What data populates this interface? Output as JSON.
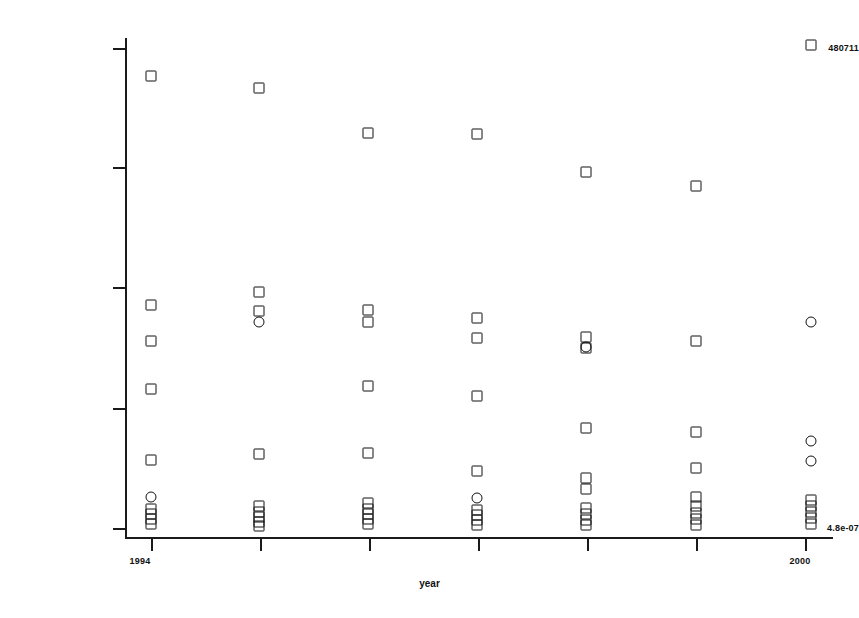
{
  "chart_data": {
    "type": "scatter",
    "title": "",
    "subtitle": "",
    "xlabel": "year",
    "ylabel": "",
    "grid": false,
    "legend": null,
    "yscale": "log",
    "ylim": [
      4.8e-07,
      480711
    ],
    "xlim": [
      1994,
      2000
    ],
    "y_tick_labels": [
      "480711",
      "",
      "",
      "",
      "4.8e-07"
    ],
    "y_tick_label_top": "480711",
    "y_tick_label_bottom": "4.8e-07",
    "x_tick_labels": [
      "1994",
      "",
      "",
      "",
      "",
      "",
      "2000"
    ],
    "x_tick_label_first": "1994",
    "x_tick_label_last": "2000",
    "x_categories": [
      1994,
      1995,
      1996,
      1997,
      1998,
      1999,
      2000
    ],
    "marker_shapes": [
      "square",
      "circle"
    ],
    "marker_color": "#111111",
    "marker_fill": "none",
    "series": [
      {
        "name": "square-markers",
        "shape": "square",
        "points": [
          {
            "x": 1994,
            "px": 151,
            "py": 76
          },
          {
            "x": 1994,
            "px": 151,
            "py": 305
          },
          {
            "x": 1994,
            "px": 151,
            "py": 341
          },
          {
            "x": 1994,
            "px": 151,
            "py": 389
          },
          {
            "x": 1994,
            "px": 151,
            "py": 460
          },
          {
            "x": 1994,
            "px": 151,
            "py": 509
          },
          {
            "x": 1994,
            "px": 151,
            "py": 514
          },
          {
            "x": 1994,
            "px": 151,
            "py": 519
          },
          {
            "x": 1994,
            "px": 151,
            "py": 524
          },
          {
            "x": 1995,
            "px": 259,
            "py": 88
          },
          {
            "x": 1995,
            "px": 259,
            "py": 292
          },
          {
            "x": 1995,
            "px": 259,
            "py": 311
          },
          {
            "x": 1995,
            "px": 259,
            "py": 454
          },
          {
            "x": 1995,
            "px": 259,
            "py": 506
          },
          {
            "x": 1995,
            "px": 259,
            "py": 512
          },
          {
            "x": 1995,
            "px": 259,
            "py": 517
          },
          {
            "x": 1995,
            "px": 259,
            "py": 522
          },
          {
            "x": 1995,
            "px": 259,
            "py": 526
          },
          {
            "x": 1996,
            "px": 368,
            "py": 133
          },
          {
            "x": 1996,
            "px": 368,
            "py": 310
          },
          {
            "x": 1996,
            "px": 368,
            "py": 322
          },
          {
            "x": 1996,
            "px": 368,
            "py": 386
          },
          {
            "x": 1996,
            "px": 368,
            "py": 453
          },
          {
            "x": 1996,
            "px": 368,
            "py": 503
          },
          {
            "x": 1996,
            "px": 368,
            "py": 509
          },
          {
            "x": 1996,
            "px": 368,
            "py": 514
          },
          {
            "x": 1996,
            "px": 368,
            "py": 519
          },
          {
            "x": 1996,
            "px": 368,
            "py": 524
          },
          {
            "x": 1997,
            "px": 477,
            "py": 134
          },
          {
            "x": 1997,
            "px": 477,
            "py": 318
          },
          {
            "x": 1997,
            "px": 477,
            "py": 338
          },
          {
            "x": 1997,
            "px": 477,
            "py": 396
          },
          {
            "x": 1997,
            "px": 477,
            "py": 471
          },
          {
            "x": 1997,
            "px": 477,
            "py": 510
          },
          {
            "x": 1997,
            "px": 477,
            "py": 515
          },
          {
            "x": 1997,
            "px": 477,
            "py": 520
          },
          {
            "x": 1997,
            "px": 477,
            "py": 525
          },
          {
            "x": 1998,
            "px": 586,
            "py": 172
          },
          {
            "x": 1998,
            "px": 586,
            "py": 337
          },
          {
            "x": 1998,
            "px": 586,
            "py": 348
          },
          {
            "x": 1998,
            "px": 586,
            "py": 428
          },
          {
            "x": 1998,
            "px": 586,
            "py": 478
          },
          {
            "x": 1998,
            "px": 586,
            "py": 489
          },
          {
            "x": 1998,
            "px": 586,
            "py": 508
          },
          {
            "x": 1998,
            "px": 586,
            "py": 514
          },
          {
            "x": 1998,
            "px": 586,
            "py": 520
          },
          {
            "x": 1998,
            "px": 586,
            "py": 525
          },
          {
            "x": 1999,
            "px": 696,
            "py": 186
          },
          {
            "x": 1999,
            "px": 696,
            "py": 341
          },
          {
            "x": 1999,
            "px": 696,
            "py": 432
          },
          {
            "x": 1999,
            "px": 696,
            "py": 468
          },
          {
            "x": 1999,
            "px": 696,
            "py": 497
          },
          {
            "x": 1999,
            "px": 696,
            "py": 506
          },
          {
            "x": 1999,
            "px": 696,
            "py": 513
          },
          {
            "x": 1999,
            "px": 696,
            "py": 519
          },
          {
            "x": 1999,
            "px": 696,
            "py": 525
          },
          {
            "x": 2000,
            "px": 811,
            "py": 45
          },
          {
            "x": 2000,
            "px": 811,
            "py": 500
          },
          {
            "x": 2000,
            "px": 811,
            "py": 506
          },
          {
            "x": 2000,
            "px": 811,
            "py": 512
          },
          {
            "x": 2000,
            "px": 811,
            "py": 518
          },
          {
            "x": 2000,
            "px": 811,
            "py": 524
          }
        ]
      },
      {
        "name": "circle-markers",
        "shape": "circle",
        "points": [
          {
            "x": 1994,
            "px": 151,
            "py": 497
          },
          {
            "x": 1995,
            "px": 259,
            "py": 322
          },
          {
            "x": 1997,
            "px": 477,
            "py": 498
          },
          {
            "x": 1998,
            "px": 586,
            "py": 347
          },
          {
            "x": 2000,
            "px": 811,
            "py": 322
          },
          {
            "x": 2000,
            "px": 811,
            "py": 441
          },
          {
            "x": 2000,
            "px": 811,
            "py": 461
          }
        ]
      }
    ],
    "y_tick_positions_px": [
      48,
      167,
      287,
      408,
      528
    ],
    "x_tick_positions_px": [
      151,
      260,
      369,
      478,
      587,
      696,
      805
    ]
  }
}
